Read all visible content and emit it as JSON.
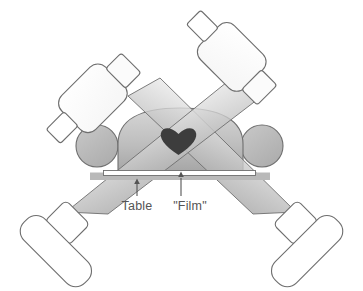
{
  "figure": {
    "background_color": "#ffffff"
  },
  "labels": {
    "table": "Table",
    "film": "\"Film\"",
    "table_color": "#545454",
    "film_color": "#545454"
  },
  "icons": {
    "heart": "heart-icon",
    "table_pointer": "arrow-up-icon",
    "film_pointer": "arrow-up-icon"
  },
  "components": {
    "patient_torso": {
      "name": "patient-torso",
      "fill_top": "#d3d3d3",
      "fill_bottom": "#9f9f9f",
      "stroke": "#6e6e6e"
    },
    "left_arm": {
      "name": "patient-left-arm",
      "fill": "#b6b6b6",
      "stroke": "#6e6e6e"
    },
    "right_arm": {
      "name": "patient-right-arm",
      "fill": "#b6b6b6",
      "stroke": "#6e6e6e"
    },
    "heart": {
      "name": "heart-organ",
      "fill": "#404040"
    },
    "table": {
      "name": "imaging-table",
      "fill": "#b9b9b9",
      "stroke": "#b9b9b9"
    },
    "film": {
      "name": "film-cassette",
      "fill": "#ffffff",
      "stroke": "#707070"
    },
    "tube_left": {
      "name": "xray-tube-left",
      "fill": "#ffffff",
      "stroke": "#6e6e6e"
    },
    "tube_right": {
      "name": "xray-tube-right",
      "fill": "#ffffff",
      "stroke": "#6e6e6e"
    },
    "detector_left": {
      "name": "image-detector-left",
      "fill": "#ffffff",
      "stroke": "#6e6e6e"
    },
    "detector_right": {
      "name": "image-detector-right",
      "fill": "#ffffff",
      "stroke": "#6e6e6e"
    },
    "beam_left": {
      "name": "xray-beam-left",
      "fill_top": "#f0f0f0",
      "fill_bottom": "#8c8c8c",
      "stroke": "#6e6e6e"
    },
    "beam_right": {
      "name": "xray-beam-right",
      "fill_top": "#f0f0f0",
      "fill_bottom": "#8c8c8c",
      "stroke": "#6e6e6e"
    }
  }
}
